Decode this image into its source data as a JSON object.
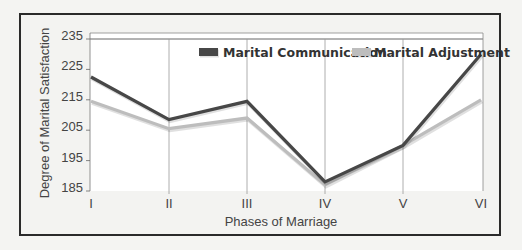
{
  "chart_data": {
    "type": "line",
    "title": "",
    "xlabel": "Phases of Marriage",
    "ylabel": "Degree of Marital Satisfaction",
    "categories": [
      "I",
      "II",
      "III",
      "IV",
      "V",
      "VI"
    ],
    "yticks": [
      185,
      195,
      205,
      215,
      225,
      235
    ],
    "ylim": [
      185,
      235
    ],
    "grid": {
      "vertical": true,
      "horizontal": false
    },
    "legend_position": "top-right inside",
    "series": [
      {
        "name": "Marital Communication",
        "color": "#474747",
        "values": [
          222.5,
          208.5,
          214.5,
          188,
          200,
          230
        ]
      },
      {
        "name": "Marital Adjustment",
        "color": "#bdbdbd",
        "values": [
          214.5,
          205.5,
          209,
          187,
          200,
          215
        ]
      }
    ]
  }
}
